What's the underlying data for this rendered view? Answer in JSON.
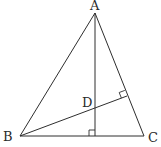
{
  "diagram": {
    "type": "geometry",
    "points": {
      "A": {
        "label": "A",
        "x": 95,
        "y": 13
      },
      "B": {
        "label": "B",
        "x": 20,
        "y": 136
      },
      "C": {
        "label": "C",
        "x": 144,
        "y": 136
      },
      "D": {
        "label": "D",
        "x": 95,
        "y": 107
      },
      "foot_A": {
        "x": 95,
        "y": 136
      },
      "foot_B": {
        "x": 127,
        "y": 96
      }
    },
    "labels": {
      "A": "A",
      "B": "B",
      "C": "C",
      "D": "D"
    },
    "segments": [
      [
        "A",
        "B"
      ],
      [
        "B",
        "C"
      ],
      [
        "C",
        "A"
      ],
      [
        "A",
        "foot_A"
      ],
      [
        "B",
        "foot_B"
      ]
    ],
    "right_angles": [
      "foot_A",
      "foot_B"
    ],
    "colors": {
      "line": "#2e2e2e",
      "text": "#2a2a2a",
      "background": "#ffffff"
    }
  }
}
